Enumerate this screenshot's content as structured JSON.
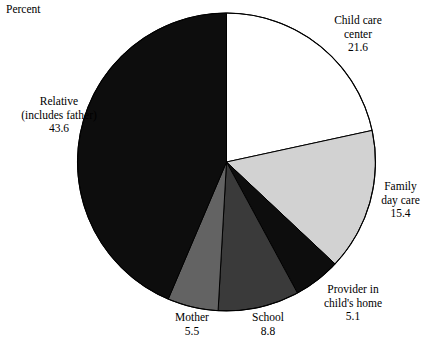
{
  "axis": {
    "title": "Percent"
  },
  "chart_data": {
    "type": "pie",
    "title": "",
    "ylabel": "Percent",
    "xlabel": "",
    "grid": false,
    "legend_position": "none",
    "start_angle_deg": 90,
    "direction": "clockwise",
    "units": "percent",
    "total": 100.0,
    "categories": [
      "Child care center",
      "Family day care",
      "Provider in child's home",
      "School",
      "Mother",
      "Relative (includes father)"
    ],
    "values": [
      21.6,
      15.4,
      5.1,
      8.8,
      5.5,
      43.6
    ],
    "colors": [
      "#ffffff",
      "#d2d2d2",
      "#0d0d0d",
      "#3a3a3a",
      "#636363",
      "#0d0d0d"
    ],
    "slices": [
      {
        "label": "Child care center",
        "value": 21.6,
        "color": "#ffffff"
      },
      {
        "label": "Family day care",
        "value": 15.4,
        "color": "#d2d2d2"
      },
      {
        "label": "Provider in child's home",
        "value": 5.1,
        "color": "#0d0d0d"
      },
      {
        "label": "School",
        "value": 8.8,
        "color": "#3a3a3a"
      },
      {
        "label": "Mother",
        "value": 5.5,
        "color": "#636363"
      },
      {
        "label": "Relative (includes father)",
        "value": 43.6,
        "color": "#0d0d0d"
      }
    ]
  },
  "labels": {
    "child_care_center": {
      "line1": "Child care",
      "line2": "center",
      "value": "21.6"
    },
    "family_day_care": {
      "line1": "Family",
      "line2": "day care",
      "value": "15.4"
    },
    "provider_home": {
      "line1": "Provider in",
      "line2": "child's home",
      "value": "5.1"
    },
    "school": {
      "line1": "School",
      "value": "8.8"
    },
    "mother": {
      "line1": "Mother",
      "value": "5.5"
    },
    "relative": {
      "line1": "Relative",
      "line2": "(includes father)",
      "value": "43.6"
    }
  }
}
